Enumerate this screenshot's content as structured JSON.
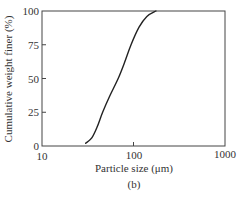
{
  "chart_data": {
    "type": "line",
    "title": "",
    "subtitle": "(b)",
    "xlabel": "Particle size (μm)",
    "ylabel": "Cumulative weight finer (%)",
    "xscale": "log",
    "xlim": [
      10,
      1000
    ],
    "ylim": [
      0,
      100
    ],
    "xticks": [
      10,
      100,
      1000
    ],
    "xtick_labels": [
      "10",
      "100",
      "1000"
    ],
    "yticks": [
      0,
      25,
      50,
      75,
      100
    ],
    "ytick_labels": [
      "0",
      "25",
      "50",
      "75",
      "100"
    ],
    "grid": false,
    "legend": null,
    "series": [
      {
        "name": "Cumulative weight finer",
        "x": [
          30,
          35,
          40,
          46,
          55,
          68,
          80,
          94,
          115,
          140,
          176
        ],
        "y": [
          2,
          6,
          14,
          25,
          37,
          50,
          62,
          75,
          88,
          96,
          100
        ]
      }
    ]
  }
}
